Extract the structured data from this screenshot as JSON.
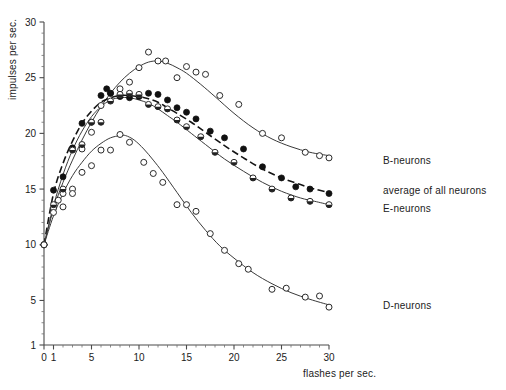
{
  "chart_data": {
    "type": "line",
    "title": "",
    "xlabel": "flashes per sec.",
    "ylabel": "impulses per sec.",
    "xlim": [
      0,
      30
    ],
    "ylim": [
      1,
      30
    ],
    "grid": false,
    "legend_position": "right-inline",
    "x_ticks": [
      0,
      1,
      5,
      10,
      15,
      20,
      25,
      30
    ],
    "x_tick_labels": [
      "0",
      "1",
      "5",
      "10",
      "15",
      "20",
      "25",
      "30"
    ],
    "x_minor_ticks": [
      2,
      3,
      4,
      6,
      7,
      8,
      9,
      11,
      12,
      13,
      14,
      16,
      17,
      18,
      19,
      21,
      22,
      23,
      24,
      26,
      27,
      28,
      29
    ],
    "y_ticks": [
      1,
      5,
      10,
      15,
      20,
      25,
      30
    ],
    "y_tick_labels": [
      "1",
      "5",
      "10",
      "15",
      "20",
      "25",
      "30"
    ],
    "y_minor_ticks": [
      2,
      3,
      4,
      6,
      7,
      8,
      9,
      11,
      12,
      13,
      14,
      16,
      17,
      18,
      19,
      21,
      22,
      23,
      24,
      26,
      27,
      28,
      29
    ],
    "series": [
      {
        "name": "B-neurons",
        "label": "B-neurons",
        "marker": "open-circle",
        "line_style": "solid",
        "color": "#3a3a3a",
        "label_x": 31.2,
        "label_y": 17.6,
        "points": [
          {
            "x": 0.0,
            "y": 10.0
          },
          {
            "x": 1.0,
            "y": 13.3
          },
          {
            "x": 1.5,
            "y": 14.0
          },
          {
            "x": 2.0,
            "y": 14.6
          },
          {
            "x": 3.0,
            "y": 15.0
          },
          {
            "x": 4.0,
            "y": 18.6
          },
          {
            "x": 5.0,
            "y": 20.1
          },
          {
            "x": 6.0,
            "y": 22.5
          },
          {
            "x": 7.0,
            "y": 23.6
          },
          {
            "x": 8.0,
            "y": 24.0
          },
          {
            "x": 9.0,
            "y": 24.6
          },
          {
            "x": 10.0,
            "y": 25.9
          },
          {
            "x": 11.0,
            "y": 27.3
          },
          {
            "x": 12.0,
            "y": 26.5
          },
          {
            "x": 12.8,
            "y": 26.5
          },
          {
            "x": 14.0,
            "y": 25.0
          },
          {
            "x": 15.0,
            "y": 26.0
          },
          {
            "x": 16.0,
            "y": 25.5
          },
          {
            "x": 17.0,
            "y": 25.3
          },
          {
            "x": 18.5,
            "y": 23.4
          },
          {
            "x": 20.5,
            "y": 22.6
          },
          {
            "x": 23.0,
            "y": 20.0
          },
          {
            "x": 25.0,
            "y": 19.6
          },
          {
            "x": 27.5,
            "y": 18.3
          },
          {
            "x": 29.0,
            "y": 18.0
          },
          {
            "x": 30.0,
            "y": 17.8
          }
        ],
        "curve": [
          {
            "x": 0.0,
            "y": 10.0
          },
          {
            "x": 1.0,
            "y": 13.2
          },
          {
            "x": 2.0,
            "y": 15.6
          },
          {
            "x": 3.0,
            "y": 17.6
          },
          {
            "x": 4.0,
            "y": 19.4
          },
          {
            "x": 5.0,
            "y": 21.0
          },
          {
            "x": 6.0,
            "y": 22.4
          },
          {
            "x": 7.0,
            "y": 23.6
          },
          {
            "x": 8.0,
            "y": 24.6
          },
          {
            "x": 9.0,
            "y": 25.4
          },
          {
            "x": 10.0,
            "y": 26.0
          },
          {
            "x": 11.0,
            "y": 26.4
          },
          {
            "x": 12.0,
            "y": 26.5
          },
          {
            "x": 13.0,
            "y": 26.3
          },
          {
            "x": 14.0,
            "y": 25.9
          },
          {
            "x": 15.0,
            "y": 25.4
          },
          {
            "x": 16.5,
            "y": 24.4
          },
          {
            "x": 18.0,
            "y": 23.3
          },
          {
            "x": 20.0,
            "y": 21.8
          },
          {
            "x": 22.0,
            "y": 20.5
          },
          {
            "x": 24.0,
            "y": 19.5
          },
          {
            "x": 26.0,
            "y": 18.8
          },
          {
            "x": 28.0,
            "y": 18.3
          },
          {
            "x": 30.0,
            "y": 18.0
          }
        ]
      },
      {
        "name": "average-of-all-neurons",
        "label": "average of all neurons",
        "marker": "filled-circle",
        "line_style": "dashed",
        "color": "#141414",
        "label_x": 31.2,
        "label_y": 14.9,
        "points": [
          {
            "x": 0.0,
            "y": 10.0
          },
          {
            "x": 1.0,
            "y": 14.9
          },
          {
            "x": 2.0,
            "y": 16.1
          },
          {
            "x": 3.0,
            "y": 18.7
          },
          {
            "x": 4.0,
            "y": 20.9
          },
          {
            "x": 5.0,
            "y": 21.0
          },
          {
            "x": 6.0,
            "y": 23.4
          },
          {
            "x": 6.6,
            "y": 24.0
          },
          {
            "x": 7.0,
            "y": 23.6
          },
          {
            "x": 8.0,
            "y": 23.3
          },
          {
            "x": 9.0,
            "y": 23.2
          },
          {
            "x": 10.0,
            "y": 23.3
          },
          {
            "x": 11.0,
            "y": 23.6
          },
          {
            "x": 12.0,
            "y": 23.5
          },
          {
            "x": 13.0,
            "y": 23.0
          },
          {
            "x": 14.0,
            "y": 22.3
          },
          {
            "x": 15.0,
            "y": 21.9
          },
          {
            "x": 16.0,
            "y": 21.3
          },
          {
            "x": 17.5,
            "y": 20.2
          },
          {
            "x": 19.0,
            "y": 19.6
          },
          {
            "x": 21.0,
            "y": 18.6
          },
          {
            "x": 23.0,
            "y": 17.0
          },
          {
            "x": 25.0,
            "y": 16.0
          },
          {
            "x": 26.5,
            "y": 15.2
          },
          {
            "x": 28.0,
            "y": 15.0
          },
          {
            "x": 30.0,
            "y": 14.6
          }
        ],
        "curve": [
          {
            "x": 0.0,
            "y": 10.0
          },
          {
            "x": 1.0,
            "y": 14.6
          },
          {
            "x": 2.0,
            "y": 17.3
          },
          {
            "x": 3.0,
            "y": 19.3
          },
          {
            "x": 4.0,
            "y": 20.9
          },
          {
            "x": 5.0,
            "y": 22.0
          },
          {
            "x": 6.0,
            "y": 22.8
          },
          {
            "x": 7.0,
            "y": 23.2
          },
          {
            "x": 8.0,
            "y": 23.4
          },
          {
            "x": 9.0,
            "y": 23.4
          },
          {
            "x": 10.0,
            "y": 23.3
          },
          {
            "x": 11.0,
            "y": 23.1
          },
          {
            "x": 12.0,
            "y": 22.8
          },
          {
            "x": 13.0,
            "y": 22.3
          },
          {
            "x": 14.0,
            "y": 21.8
          },
          {
            "x": 15.5,
            "y": 21.0
          },
          {
            "x": 17.0,
            "y": 20.1
          },
          {
            "x": 19.0,
            "y": 18.9
          },
          {
            "x": 21.0,
            "y": 17.8
          },
          {
            "x": 23.0,
            "y": 16.8
          },
          {
            "x": 25.0,
            "y": 16.0
          },
          {
            "x": 27.0,
            "y": 15.4
          },
          {
            "x": 28.5,
            "y": 15.0
          },
          {
            "x": 30.0,
            "y": 14.7
          }
        ]
      },
      {
        "name": "E-neurons",
        "label": "E-neurons",
        "marker": "half-filled-circle",
        "line_style": "solid",
        "color": "#3a3a3a",
        "label_x": 31.2,
        "label_y": 13.3,
        "points": [
          {
            "x": 0.0,
            "y": 10.0
          },
          {
            "x": 1.0,
            "y": 13.6
          },
          {
            "x": 2.0,
            "y": 15.0
          },
          {
            "x": 3.0,
            "y": 18.5
          },
          {
            "x": 4.0,
            "y": 19.0
          },
          {
            "x": 5.0,
            "y": 21.0
          },
          {
            "x": 6.0,
            "y": 21.0
          },
          {
            "x": 7.0,
            "y": 22.9
          },
          {
            "x": 8.0,
            "y": 23.5
          },
          {
            "x": 9.0,
            "y": 23.6
          },
          {
            "x": 10.0,
            "y": 23.5
          },
          {
            "x": 11.0,
            "y": 22.6
          },
          {
            "x": 12.0,
            "y": 22.4
          },
          {
            "x": 13.0,
            "y": 22.2
          },
          {
            "x": 14.0,
            "y": 21.2
          },
          {
            "x": 15.0,
            "y": 20.6
          },
          {
            "x": 16.5,
            "y": 19.7
          },
          {
            "x": 18.0,
            "y": 18.3
          },
          {
            "x": 20.0,
            "y": 17.4
          },
          {
            "x": 22.0,
            "y": 16.0
          },
          {
            "x": 24.0,
            "y": 15.0
          },
          {
            "x": 26.0,
            "y": 14.2
          },
          {
            "x": 28.0,
            "y": 13.9
          },
          {
            "x": 30.0,
            "y": 13.6
          }
        ],
        "curve": [
          {
            "x": 0.0,
            "y": 10.0
          },
          {
            "x": 1.0,
            "y": 13.5
          },
          {
            "x": 2.0,
            "y": 16.3
          },
          {
            "x": 3.0,
            "y": 18.5
          },
          {
            "x": 4.0,
            "y": 20.2
          },
          {
            "x": 5.0,
            "y": 21.5
          },
          {
            "x": 6.0,
            "y": 22.4
          },
          {
            "x": 7.0,
            "y": 23.0
          },
          {
            "x": 8.0,
            "y": 23.2
          },
          {
            "x": 9.0,
            "y": 23.2
          },
          {
            "x": 10.0,
            "y": 23.0
          },
          {
            "x": 11.0,
            "y": 22.7
          },
          {
            "x": 12.0,
            "y": 22.2
          },
          {
            "x": 13.0,
            "y": 21.6
          },
          {
            "x": 14.0,
            "y": 21.0
          },
          {
            "x": 15.5,
            "y": 20.0
          },
          {
            "x": 17.0,
            "y": 19.0
          },
          {
            "x": 19.0,
            "y": 17.7
          },
          {
            "x": 21.0,
            "y": 16.6
          },
          {
            "x": 23.0,
            "y": 15.6
          },
          {
            "x": 25.0,
            "y": 14.8
          },
          {
            "x": 27.0,
            "y": 14.2
          },
          {
            "x": 28.5,
            "y": 13.9
          },
          {
            "x": 30.0,
            "y": 13.6
          }
        ]
      },
      {
        "name": "D-neurons",
        "label": "D-neurons",
        "marker": "open-circle",
        "line_style": "solid",
        "color": "#3a3a3a",
        "label_x": 31.2,
        "label_y": 4.6,
        "points": [
          {
            "x": 0.0,
            "y": 10.0
          },
          {
            "x": 1.0,
            "y": 12.9
          },
          {
            "x": 2.0,
            "y": 13.4
          },
          {
            "x": 3.0,
            "y": 14.6
          },
          {
            "x": 4.0,
            "y": 16.5
          },
          {
            "x": 5.0,
            "y": 17.1
          },
          {
            "x": 6.0,
            "y": 18.5
          },
          {
            "x": 7.0,
            "y": 18.5
          },
          {
            "x": 8.0,
            "y": 19.9
          },
          {
            "x": 9.0,
            "y": 19.2
          },
          {
            "x": 10.5,
            "y": 17.4
          },
          {
            "x": 11.5,
            "y": 16.4
          },
          {
            "x": 12.5,
            "y": 15.6
          },
          {
            "x": 14.0,
            "y": 13.6
          },
          {
            "x": 15.0,
            "y": 13.6
          },
          {
            "x": 16.0,
            "y": 13.0
          },
          {
            "x": 17.5,
            "y": 11.0
          },
          {
            "x": 19.0,
            "y": 9.5
          },
          {
            "x": 20.5,
            "y": 8.3
          },
          {
            "x": 21.5,
            "y": 7.8
          },
          {
            "x": 24.0,
            "y": 6.0
          },
          {
            "x": 25.5,
            "y": 6.1
          },
          {
            "x": 27.5,
            "y": 5.3
          },
          {
            "x": 29.0,
            "y": 5.4
          },
          {
            "x": 30.0,
            "y": 4.4
          }
        ],
        "curve": [
          {
            "x": 0.0,
            "y": 10.0
          },
          {
            "x": 1.0,
            "y": 12.6
          },
          {
            "x": 2.0,
            "y": 14.6
          },
          {
            "x": 3.0,
            "y": 16.2
          },
          {
            "x": 4.0,
            "y": 17.4
          },
          {
            "x": 5.0,
            "y": 18.4
          },
          {
            "x": 6.0,
            "y": 19.1
          },
          {
            "x": 7.0,
            "y": 19.6
          },
          {
            "x": 8.0,
            "y": 19.8
          },
          {
            "x": 8.6,
            "y": 19.8
          },
          {
            "x": 9.5,
            "y": 19.4
          },
          {
            "x": 10.5,
            "y": 18.6
          },
          {
            "x": 11.5,
            "y": 17.6
          },
          {
            "x": 12.5,
            "y": 16.5
          },
          {
            "x": 14.0,
            "y": 14.7
          },
          {
            "x": 15.5,
            "y": 12.9
          },
          {
            "x": 17.0,
            "y": 11.3
          },
          {
            "x": 18.5,
            "y": 9.9
          },
          {
            "x": 20.0,
            "y": 8.8
          },
          {
            "x": 22.0,
            "y": 7.5
          },
          {
            "x": 24.0,
            "y": 6.5
          },
          {
            "x": 26.0,
            "y": 5.7
          },
          {
            "x": 28.0,
            "y": 5.1
          },
          {
            "x": 30.0,
            "y": 4.6
          }
        ]
      }
    ]
  }
}
